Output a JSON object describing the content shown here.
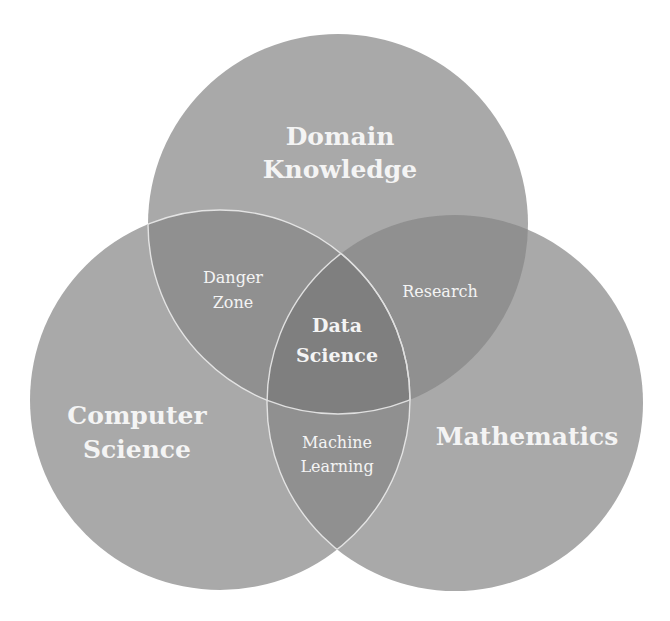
{
  "diagram": {
    "type": "venn",
    "colors": {
      "background": "#ffffff",
      "circle_fill": "#a9a9a9",
      "overlap_fill": "#909090",
      "center_fill": "#7f7f7f",
      "outline": "#f0f0f0",
      "label": "#f4f4f4"
    },
    "sets": {
      "top": "Domain Knowledge",
      "left": "Computer Science",
      "right": "Mathematics"
    },
    "labels": {
      "top_line1": "Domain",
      "top_line2": "Knowledge",
      "left_line1": "Computer",
      "left_line2": "Science",
      "right": "Mathematics",
      "top_left_line1": "Danger",
      "top_left_line2": "Zone",
      "top_right": "Research",
      "left_right_line1": "Machine",
      "left_right_line2": "Learning",
      "center_line1": "Data",
      "center_line2": "Science"
    }
  }
}
